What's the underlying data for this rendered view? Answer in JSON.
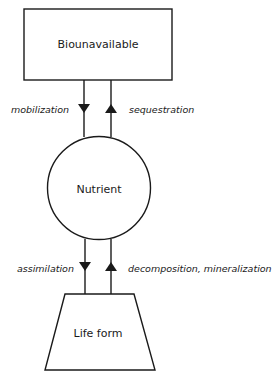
{
  "diagram": {
    "nodes": [
      {
        "id": "biounavailable",
        "label": "Biounavailable",
        "shape": "rectangle"
      },
      {
        "id": "nutrient",
        "label": "Nutrient",
        "shape": "circle"
      },
      {
        "id": "life_form",
        "label": "Life form",
        "shape": "trapezoid"
      }
    ],
    "edges": [
      {
        "from": "biounavailable",
        "to": "nutrient",
        "label": "mobilization"
      },
      {
        "from": "nutrient",
        "to": "biounavailable",
        "label": "sequestration"
      },
      {
        "from": "nutrient",
        "to": "life_form",
        "label": "assimilation"
      },
      {
        "from": "life_form",
        "to": "nutrient",
        "label": "decomposition, mineralization"
      }
    ]
  },
  "colors": {
    "stroke": "#1a1a1a",
    "background": "#ffffff"
  }
}
